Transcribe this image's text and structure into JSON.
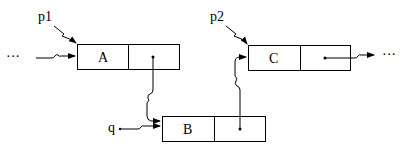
{
  "diagram": {
    "type": "linked-list-insertion",
    "nodes": [
      {
        "id": "A",
        "label": "A"
      },
      {
        "id": "B",
        "label": "B"
      },
      {
        "id": "C",
        "label": "C"
      }
    ],
    "pointers": [
      {
        "id": "p1",
        "label": "p1",
        "target": "A"
      },
      {
        "id": "p2",
        "label": "p2",
        "target": "C"
      },
      {
        "id": "q",
        "label": "q",
        "target": "B"
      }
    ],
    "edges": [
      {
        "from": "ellipsis-left",
        "to": "A"
      },
      {
        "from": "A.next",
        "to": "B"
      },
      {
        "from": "B.next",
        "to": "C"
      },
      {
        "from": "C.next",
        "to": "ellipsis-right"
      }
    ],
    "ellipsis_left": "···",
    "ellipsis_right": "···"
  }
}
